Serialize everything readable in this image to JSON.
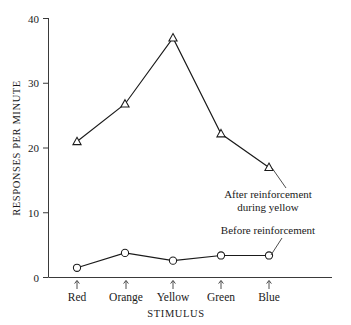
{
  "chart_data": {
    "type": "line",
    "title": "",
    "xlabel": "STIMULUS",
    "ylabel": "RESPONSES PER MINUTE",
    "categories": [
      "Red",
      "Orange",
      "Yellow",
      "Green",
      "Blue"
    ],
    "ylim": [
      0,
      40
    ],
    "yticks": [
      0,
      10,
      20,
      30,
      40
    ],
    "ytick_labels": [
      "0",
      "10",
      "20",
      "30",
      "40"
    ],
    "grid": false,
    "legend_position": "inline-annotations",
    "series": [
      {
        "name": "After reinforcement during yellow",
        "marker": "triangle-up",
        "values": [
          21,
          26.8,
          37,
          22.2,
          17
        ]
      },
      {
        "name": "Before reinforcement",
        "marker": "circle",
        "values": [
          1.5,
          3.8,
          2.6,
          3.4,
          3.4
        ]
      }
    ],
    "annotations": [
      {
        "id": "after-reinforcement",
        "line1": "After reinforcement",
        "line2": "during yellow",
        "points_to": "Blue triangle"
      },
      {
        "id": "before-reinforcement",
        "line1": "Before reinforcement",
        "line2": "",
        "points_to": "Blue circle"
      }
    ]
  },
  "axes": {
    "y_title": "RESPONSES PER MINUTE",
    "x_title": "STIMULUS",
    "y_labels": {
      "t0": "0",
      "t10": "10",
      "t20": "20",
      "t30": "30",
      "t40": "40"
    },
    "x_labels": {
      "c0": "Red",
      "c1": "Orange",
      "c2": "Yellow",
      "c3": "Green",
      "c4": "Blue"
    }
  },
  "annotations": {
    "after_line1": "After reinforcement",
    "after_line2": "during yellow",
    "before_line1": "Before reinforcement"
  },
  "colors": {
    "ink": "#1a1a1a",
    "axis": "#3a3a3a",
    "background": "#ffffff"
  }
}
